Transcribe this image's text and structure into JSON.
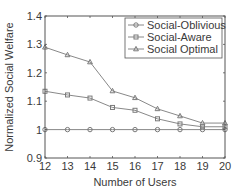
{
  "chart_data": {
    "type": "line",
    "title": "",
    "xlabel": "Number of Users",
    "ylabel": "Normalized Social Welfare",
    "x": [
      12,
      13,
      14,
      15,
      16,
      17,
      18,
      19,
      20
    ],
    "xlim": [
      12,
      20
    ],
    "ylim": [
      0.9,
      1.4
    ],
    "xticks": [
      "12",
      "13",
      "14",
      "15",
      "16",
      "17",
      "18",
      "19",
      "20"
    ],
    "yticks": [
      "0.9",
      "1",
      "1.1",
      "1.2",
      "1.3",
      "1.4"
    ],
    "ytick_values": [
      0.9,
      1.0,
      1.1,
      1.2,
      1.3,
      1.4
    ],
    "grid": false,
    "legend_position": "upper right",
    "series": [
      {
        "name": "Social-Oblivious",
        "marker": "circle",
        "values": [
          1.0,
          1.0,
          1.0,
          1.0,
          1.0,
          1.0,
          1.0,
          1.0,
          1.0
        ]
      },
      {
        "name": "Social-Aware",
        "marker": "square",
        "values": [
          1.135,
          1.122,
          1.111,
          1.078,
          1.068,
          1.038,
          1.02,
          1.01,
          1.01
        ]
      },
      {
        "name": "Social Optimal",
        "marker": "triangle",
        "values": [
          1.29,
          1.263,
          1.238,
          1.136,
          1.112,
          1.073,
          1.048,
          1.023,
          1.023
        ]
      }
    ],
    "colors": {
      "line": "#7a7a7a",
      "axis": "#555555",
      "text": "#3a3a3a"
    }
  }
}
